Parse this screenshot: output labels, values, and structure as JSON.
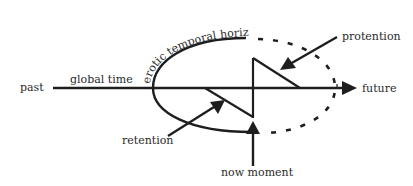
{
  "diagram": {
    "labels": {
      "past": "past",
      "global_time": "global time",
      "erotic_temporal_horizon": "erotic temporal horizon",
      "protention": "protention",
      "future": "future",
      "retention": "retention",
      "now_moment": "now moment"
    },
    "colors": {
      "stroke": "#1e1e1e",
      "text": "#2a2a2a",
      "background": "#ffffff"
    }
  }
}
